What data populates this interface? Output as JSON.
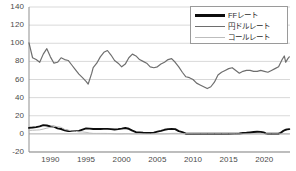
{
  "chart_data": {
    "type": "line",
    "title": "",
    "subtitle": "",
    "xlabel": "",
    "ylabel": "",
    "xlim": [
      1987,
      2023.6
    ],
    "ylim": [
      -20,
      140
    ],
    "grid": true,
    "grid_axis": "y",
    "legend_position": "top-right",
    "y_ticks": [
      140,
      120,
      100,
      80,
      60,
      40,
      20,
      0,
      -20
    ],
    "y_tick_labels": [
      "140",
      "120",
      "100",
      "80",
      "60",
      "40",
      "20",
      "0",
      "-20"
    ],
    "x_ticks": [
      1990,
      1995,
      2000,
      2005,
      2010,
      2015,
      2020
    ],
    "x_tick_labels": [
      "1990",
      "1995",
      "2000",
      "2005",
      "2010",
      "2015",
      "2020"
    ],
    "series": [
      {
        "name": "FFレート",
        "color": "#0d0d0d",
        "width": 1.9,
        "x": [
          1987.0,
          1987.5,
          1988.0,
          1988.5,
          1989.0,
          1989.5,
          1990.0,
          1990.5,
          1991.0,
          1991.5,
          1992.0,
          1992.5,
          1993.0,
          1993.5,
          1994.0,
          1994.5,
          1995.0,
          1995.5,
          1996.0,
          1996.5,
          1997.0,
          1997.5,
          1998.0,
          1998.5,
          1999.0,
          1999.5,
          2000.0,
          2000.5,
          2001.0,
          2001.5,
          2002.0,
          2002.5,
          2003.0,
          2003.5,
          2004.0,
          2004.5,
          2005.0,
          2005.5,
          2006.0,
          2006.5,
          2007.0,
          2007.5,
          2008.0,
          2008.5,
          2009.0,
          2010.0,
          2011.0,
          2012.0,
          2013.0,
          2014.0,
          2015.0,
          2015.8,
          2016.5,
          2017.0,
          2017.5,
          2018.0,
          2018.5,
          2019.0,
          2019.5,
          2019.9,
          2020.2,
          2020.5,
          2021.0,
          2021.5,
          2022.0,
          2022.3,
          2022.6,
          2022.9,
          2023.2,
          2023.5
        ],
        "y": [
          6.6,
          7.0,
          7.5,
          8.3,
          9.7,
          9.2,
          8.2,
          8.0,
          6.1,
          5.4,
          4.0,
          3.2,
          3.0,
          3.0,
          3.3,
          4.7,
          6.0,
          5.8,
          5.4,
          5.3,
          5.3,
          5.5,
          5.5,
          5.2,
          4.8,
          5.2,
          5.8,
          6.5,
          5.6,
          3.5,
          1.8,
          1.7,
          1.3,
          1.0,
          1.0,
          1.4,
          2.5,
          3.3,
          4.5,
          5.2,
          5.3,
          5.2,
          3.0,
          2.0,
          0.2,
          0.2,
          0.1,
          0.15,
          0.12,
          0.1,
          0.12,
          0.25,
          0.4,
          0.9,
          1.2,
          1.6,
          2.0,
          2.4,
          2.2,
          1.6,
          0.6,
          0.1,
          0.08,
          0.08,
          0.2,
          1.2,
          3.0,
          4.3,
          5.0,
          5.25
        ]
      },
      {
        "name": "円ドルレート",
        "color": "#6e6e6e",
        "width": 1.2,
        "x": [
          1987.0,
          1987.5,
          1988.0,
          1988.5,
          1989.0,
          1989.5,
          1990.0,
          1990.5,
          1991.0,
          1991.5,
          1992.0,
          1992.5,
          1993.0,
          1993.5,
          1994.0,
          1994.5,
          1995.0,
          1995.3,
          1995.8,
          1996.0,
          1996.5,
          1997.0,
          1997.5,
          1998.0,
          1998.5,
          1999.0,
          1999.5,
          2000.0,
          2000.5,
          2001.0,
          2001.5,
          2002.0,
          2002.5,
          2003.0,
          2003.5,
          2004.0,
          2004.5,
          2005.0,
          2005.5,
          2006.0,
          2006.5,
          2007.0,
          2007.5,
          2008.0,
          2008.5,
          2009.0,
          2009.5,
          2010.0,
          2010.5,
          2011.0,
          2011.5,
          2012.0,
          2012.5,
          2013.0,
          2013.5,
          2014.0,
          2014.5,
          2015.0,
          2015.5,
          2016.0,
          2016.5,
          2017.0,
          2017.5,
          2018.0,
          2018.5,
          2019.0,
          2019.5,
          2020.0,
          2020.5,
          2021.0,
          2021.5,
          2022.0,
          2022.5,
          2022.8,
          2023.0,
          2023.3,
          2023.5
        ],
        "y": [
          100.5,
          84.0,
          82.0,
          79.0,
          88.0,
          94.0,
          85.0,
          78.0,
          79.0,
          84.0,
          82.0,
          81.0,
          76.0,
          71.0,
          66.0,
          62.0,
          58.0,
          55.0,
          67.0,
          73.0,
          78.0,
          85.0,
          90.0,
          92.0,
          87.0,
          81.0,
          78.0,
          74.0,
          77.0,
          84.0,
          88.0,
          86.0,
          82.0,
          80.0,
          78.0,
          74.0,
          73.0,
          74.0,
          77.0,
          79.0,
          82.0,
          83.0,
          79.0,
          74.0,
          68.0,
          63.0,
          62.0,
          60.0,
          56.0,
          54.0,
          52.0,
          50.0,
          52.0,
          57.0,
          65.0,
          68.0,
          70.0,
          72.0,
          73.0,
          70.0,
          67.0,
          69.0,
          70.0,
          70.0,
          69.0,
          69.0,
          70.0,
          69.0,
          68.0,
          70.0,
          72.0,
          74.0,
          82.0,
          86.0,
          79.0,
          83.0,
          85.0
        ]
      },
      {
        "name": "コールレート",
        "color": "#bdbdbd",
        "width": 1.0,
        "x": [
          1987.0,
          1987.5,
          1988.0,
          1988.5,
          1989.0,
          1989.5,
          1990.0,
          1990.3,
          1990.7,
          1991.0,
          1991.5,
          1992.0,
          1992.5,
          1993.0,
          1993.5,
          1994.0,
          1994.5,
          1995.0,
          1995.5,
          1996.0,
          1996.5,
          1997.0,
          1997.5,
          1998.0,
          1998.5,
          1999.0,
          1999.3,
          2000.0,
          2000.5,
          2001.0,
          2001.3,
          2002.0,
          2003.0,
          2004.0,
          2005.0,
          2006.0,
          2006.5,
          2007.0,
          2007.5,
          2008.0,
          2008.7,
          2009.0,
          2010.0,
          2011.0,
          2012.0,
          2013.0,
          2014.0,
          2015.0,
          2016.0,
          2016.3,
          2017.0,
          2018.0,
          2019.0,
          2020.0,
          2021.0,
          2022.0,
          2023.0,
          2023.5
        ],
        "y": [
          3.8,
          4.0,
          4.2,
          4.4,
          5.3,
          6.3,
          7.2,
          7.8,
          8.3,
          8.0,
          7.2,
          4.9,
          4.2,
          3.2,
          2.8,
          2.2,
          2.1,
          1.7,
          0.9,
          0.5,
          0.5,
          0.5,
          0.5,
          0.45,
          0.35,
          0.15,
          0.03,
          0.03,
          0.25,
          0.25,
          0.02,
          0.01,
          0.01,
          0.01,
          0.01,
          0.05,
          0.25,
          0.5,
          0.6,
          0.5,
          0.3,
          0.1,
          0.09,
          0.08,
          0.08,
          0.07,
          0.07,
          0.05,
          0.03,
          -0.04,
          -0.05,
          -0.06,
          -0.05,
          -0.04,
          -0.02,
          -0.02,
          -0.03,
          -0.03
        ]
      }
    ]
  },
  "legend": {
    "items": [
      {
        "label": "FFレート"
      },
      {
        "label": "円ドルレート"
      },
      {
        "label": "コールレート"
      }
    ]
  }
}
